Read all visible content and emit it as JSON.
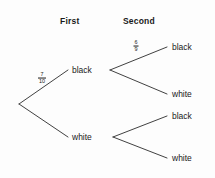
{
  "diagram": {
    "background_color": "#fdfdfd",
    "line_color": "#2b2b2b",
    "text_color": "#1a1a1a",
    "headers": [
      {
        "label": "First",
        "x": 60,
        "y": 16
      },
      {
        "label": "Second",
        "x": 123,
        "y": 16
      }
    ],
    "root": {
      "x": 19,
      "y": 104
    },
    "level1": [
      {
        "id": "first-black",
        "label": "black",
        "label_x": 72,
        "label_y": 70,
        "line": {
          "x1": 19,
          "y1": 104,
          "x2": 68,
          "y2": 70
        },
        "probability": {
          "numerator": "7",
          "denominator": "10",
          "x": 42,
          "y": 78
        },
        "branch_point": {
          "x": 110,
          "y": 70
        },
        "children": [
          {
            "id": "first-black-second-black",
            "label": "black",
            "label_x": 172,
            "label_y": 47,
            "line": {
              "x1": 110,
              "y1": 70,
              "x2": 167,
              "y2": 47
            },
            "probability": {
              "numerator": "6",
              "denominator": "9",
              "x": 136,
              "y": 46
            }
          },
          {
            "id": "first-black-second-white",
            "label": "white",
            "label_x": 172,
            "label_y": 94,
            "line": {
              "x1": 110,
              "y1": 70,
              "x2": 167,
              "y2": 94
            },
            "probability": null
          }
        ]
      },
      {
        "id": "first-white",
        "label": "white",
        "label_x": 72,
        "label_y": 137,
        "line": {
          "x1": 19,
          "y1": 104,
          "x2": 68,
          "y2": 137
        },
        "probability": null,
        "branch_point": {
          "x": 113,
          "y": 137
        },
        "children": [
          {
            "id": "first-white-second-black",
            "label": "black",
            "label_x": 172,
            "label_y": 116,
            "line": {
              "x1": 113,
              "y1": 137,
              "x2": 167,
              "y2": 116
            },
            "probability": null
          },
          {
            "id": "first-white-second-white",
            "label": "white",
            "label_x": 172,
            "label_y": 158,
            "line": {
              "x1": 113,
              "y1": 137,
              "x2": 167,
              "y2": 158
            },
            "probability": null
          }
        ]
      }
    ]
  },
  "chart_data": {
    "type": "diagram",
    "stages": [
      "First",
      "Second"
    ],
    "outcomes": [
      "black",
      "white"
    ],
    "nodes": [
      {
        "path": [
          "black"
        ],
        "label": "black",
        "probability": "7/10"
      },
      {
        "path": [
          "white"
        ],
        "label": "white",
        "probability": null
      },
      {
        "path": [
          "black",
          "black"
        ],
        "label": "black",
        "probability": "6/9"
      },
      {
        "path": [
          "black",
          "white"
        ],
        "label": "white",
        "probability": null
      },
      {
        "path": [
          "white",
          "black"
        ],
        "label": "black",
        "probability": null
      },
      {
        "path": [
          "white",
          "white"
        ],
        "label": "white",
        "probability": null
      }
    ],
    "labelled_probabilities": [
      "7/10",
      "6/9"
    ]
  }
}
